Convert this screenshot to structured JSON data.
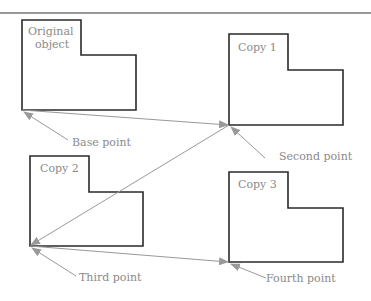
{
  "diagram": {
    "objects": [
      {
        "name": "original",
        "label_lines": [
          "Original",
          "object"
        ]
      },
      {
        "name": "copy1",
        "label_lines": [
          "Copy 1"
        ]
      },
      {
        "name": "copy2",
        "label_lines": [
          "Copy 2"
        ]
      },
      {
        "name": "copy3",
        "label_lines": [
          "Copy 3"
        ]
      }
    ],
    "points": {
      "base": "Base point",
      "second": "Second point",
      "third": "Third point",
      "fourth": "Fourth point"
    },
    "colors": {
      "outline": "#2a2a2a",
      "arrow": "#999999",
      "label": "#8a8a8a"
    }
  }
}
